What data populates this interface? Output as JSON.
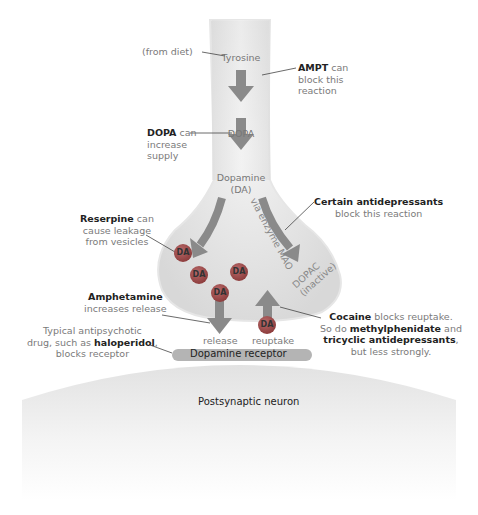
{
  "diagram": {
    "pathway": {
      "tyrosine": "Tyrosine",
      "dopa": "DOPA",
      "dopamine_line1": "Dopamine",
      "dopamine_line2": "(DA)",
      "mao_path": "via enzyme MAO",
      "dopac_line1": "DOPAC",
      "dopac_line2": "(inactive)",
      "release": "release",
      "reuptake": "reuptake",
      "receptor": "Dopamine receptor",
      "postsynaptic": "Postsynaptic neuron",
      "vesicle_label": "DA"
    },
    "annotations": {
      "from_diet": "(from diet)",
      "ampt": {
        "bold": "AMPT",
        "rest1": " can",
        "line2": "block this",
        "line3": "reaction"
      },
      "dopa": {
        "bold": "DOPA",
        "rest1": " can",
        "line2": "increase",
        "line3": "supply"
      },
      "antidepressants": {
        "bold": "Certain antidepressants",
        "line2": "block this reaction"
      },
      "reserpine": {
        "bold": "Reserpine",
        "rest1": " can",
        "line2": "cause leakage",
        "line3": "from vesicles"
      },
      "amphetamine": {
        "bold": "Amphetamine",
        "line2": "increases release"
      },
      "antipsychotic": {
        "line1": "Typical antipsychotic",
        "line2a": "drug, such as ",
        "line2bold": "haloperidol",
        "line2c": ",",
        "line3": "blocks receptor"
      },
      "cocaine": {
        "bold1": "Cocaine",
        "rest1": " blocks reuptake.",
        "line2a": "So do ",
        "line2bold": "methylphenidate",
        "line2c": " and",
        "line3bold": "tricyclic antidepressants",
        "line3c": ",",
        "line4": "but less strongly."
      }
    },
    "colors": {
      "arrow": "#8a8a8a",
      "neuron_fill": "#e8e8e8",
      "vesicle": "#9a4a4a",
      "receptor": "#b0b0b0",
      "bold_text": "#222222",
      "body_text": "#7a7a7a"
    }
  }
}
